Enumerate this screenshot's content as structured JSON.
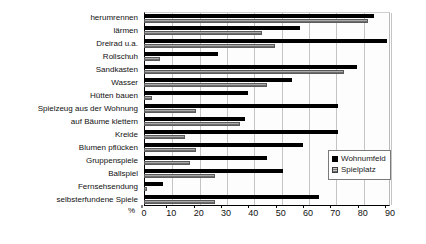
{
  "chart_data": {
    "type": "bar",
    "orientation": "horizontal",
    "title": "",
    "subtitle": "",
    "xlabel": "%",
    "ylabel": "",
    "xlim": [
      0,
      90
    ],
    "xticks": [
      0,
      10,
      20,
      30,
      40,
      50,
      60,
      70,
      80,
      90
    ],
    "xtick_labels": [
      "0",
      "10",
      "20",
      "30",
      "40",
      "50",
      "60",
      "70",
      "80",
      "90"
    ],
    "grid": "vertical",
    "legend_position": "right-inside",
    "categories": [
      "herumrennen",
      "lärmen",
      "Dreirad u.a.",
      "Rollschuh",
      "Sandkasten",
      "Wasser",
      "Hütten bauen",
      "Spielzeug aus der Wohnung",
      "auf Bäume klettern",
      "Kreide",
      "Blumen pflücken",
      "Gruppenspiele",
      "Ballspiel",
      "Fernsehsendung",
      "selbsterfundene Spiele"
    ],
    "series": [
      {
        "name": "Wohnumfeld",
        "color": "#000000",
        "values": [
          84,
          57,
          89,
          27,
          78,
          54,
          38,
          71,
          37,
          71,
          58,
          45,
          51,
          7,
          64
        ]
      },
      {
        "name": "Spielplatz",
        "color": "#a8a8a8",
        "values": [
          82,
          43,
          48,
          6,
          73,
          45,
          3,
          19,
          35,
          15,
          19,
          17,
          26,
          1,
          26
        ]
      }
    ],
    "legend": [
      "Wohnumfeld",
      "Spielplatz"
    ]
  },
  "axis": {
    "unit_label": "%"
  },
  "legend": {
    "items": [
      {
        "label": "Wohnumfeld",
        "swatch": "filled-black-square"
      },
      {
        "label": "Spielplatz",
        "swatch": "hatched-gray-square"
      }
    ]
  },
  "colors": {
    "primary_series": "#000000",
    "secondary_series": "#a8a8a8",
    "gridline": "#c4c4c4",
    "axis": "#000000",
    "background": "#ffffff"
  }
}
